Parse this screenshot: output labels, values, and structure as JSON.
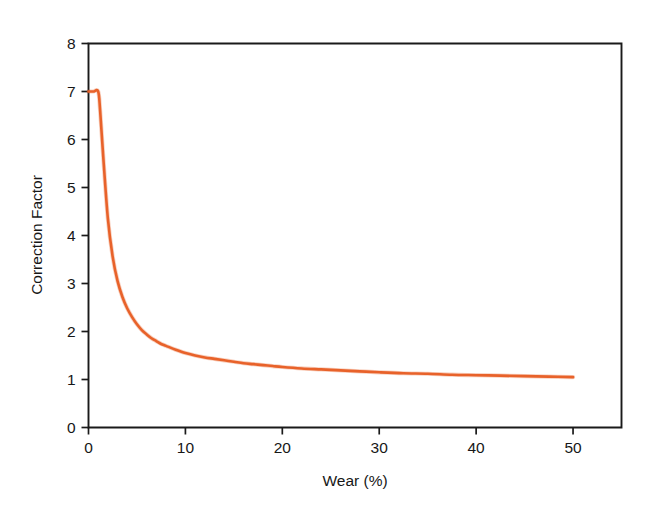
{
  "chart_data": {
    "type": "line",
    "title": "",
    "xlabel": "Wear (%)",
    "ylabel": "Correction Factor",
    "xlim": [
      0,
      55
    ],
    "ylim": [
      0,
      8
    ],
    "grid": false,
    "legend": null,
    "series_color": "#E8622A",
    "xticks": [
      0,
      10,
      20,
      30,
      40,
      50
    ],
    "xtick_labels": [
      "0",
      "10",
      "20",
      "30",
      "40",
      "50"
    ],
    "yticks": [
      0,
      1,
      2,
      3,
      4,
      5,
      6,
      7,
      8
    ],
    "ytick_labels": [
      "0",
      "1",
      "2",
      "3",
      "4",
      "5",
      "6",
      "7",
      "8"
    ],
    "series": [
      {
        "name": "Correction Factor",
        "color": "#E8622A",
        "x": [
          0,
          0.5,
          1.0,
          1.2,
          1.5,
          2.0,
          2.5,
          3.0,
          3.5,
          4.0,
          4.5,
          5.0,
          5.5,
          6.0,
          6.5,
          7.0,
          7.5,
          8.0,
          9.0,
          10.0,
          11.0,
          12.0,
          13.0,
          14.0,
          15.0,
          16.0,
          17.0,
          18.0,
          19.0,
          20.0,
          22.0,
          24.0,
          26.0,
          28.0,
          30.0,
          32.5,
          35.0,
          37.5,
          40.0,
          42.5,
          45.0,
          47.5,
          50.0
        ],
        "y": [
          7.0,
          7.0,
          7.0,
          6.6,
          5.7,
          4.35,
          3.55,
          3.05,
          2.72,
          2.48,
          2.3,
          2.15,
          2.03,
          1.94,
          1.86,
          1.8,
          1.74,
          1.7,
          1.62,
          1.55,
          1.5,
          1.46,
          1.43,
          1.4,
          1.37,
          1.34,
          1.32,
          1.3,
          1.28,
          1.26,
          1.23,
          1.21,
          1.19,
          1.17,
          1.15,
          1.13,
          1.12,
          1.1,
          1.09,
          1.08,
          1.07,
          1.06,
          1.05
        ]
      }
    ]
  },
  "axes": {
    "x_title": "Wear (%)",
    "y_title": "Correction Factor"
  }
}
